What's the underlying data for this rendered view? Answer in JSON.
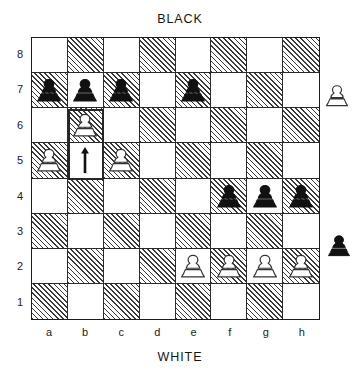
{
  "diagram": {
    "type": "chess-board-diagram",
    "top_side_label": "BLACK",
    "bottom_side_label": "WHITE",
    "orientation": "white-at-bottom",
    "files": [
      "a",
      "b",
      "c",
      "d",
      "e",
      "f",
      "g",
      "h"
    ],
    "ranks": [
      "8",
      "7",
      "6",
      "5",
      "4",
      "3",
      "2",
      "1"
    ],
    "colors": {
      "light_square": "#ffffff",
      "dark_square_hatch": "#3a3a3a",
      "border": "#1c1c1c",
      "highlight_border": "#262626",
      "black_piece": "#111111",
      "white_piece_outline": "#333333"
    },
    "position": {
      "black_pawns": [
        "a7",
        "b7",
        "c7",
        "e7",
        "f4",
        "g4",
        "h4"
      ],
      "white_pawns": [
        "b6",
        "a5",
        "c5",
        "e2",
        "f2",
        "g2",
        "h2"
      ]
    },
    "annotations": {
      "move_arrow": {
        "icon": "up-arrow-icon",
        "square": "b5",
        "direction": "up",
        "meaning": "pawn advance"
      },
      "highlight": {
        "squares": [
          "b6",
          "b5"
        ],
        "meaning": "highlighted move squares"
      }
    },
    "offboard_pieces": [
      {
        "name": "captured-white-pawn",
        "icon": "white-pawn-icon",
        "side": "white",
        "position": "right-upper"
      },
      {
        "name": "captured-black-pawn",
        "icon": "black-pawn-icon",
        "side": "black",
        "position": "right-lower"
      }
    ],
    "squares": [
      [
        {
          "id": "a8",
          "shade": "light",
          "piece": null
        },
        {
          "id": "b8",
          "shade": "dark",
          "piece": null
        },
        {
          "id": "c8",
          "shade": "light",
          "piece": null
        },
        {
          "id": "d8",
          "shade": "dark",
          "piece": null
        },
        {
          "id": "e8",
          "shade": "light",
          "piece": null
        },
        {
          "id": "f8",
          "shade": "dark",
          "piece": null
        },
        {
          "id": "g8",
          "shade": "light",
          "piece": null
        },
        {
          "id": "h8",
          "shade": "dark",
          "piece": null
        }
      ],
      [
        {
          "id": "a7",
          "shade": "dark",
          "piece": "black-pawn"
        },
        {
          "id": "b7",
          "shade": "light",
          "piece": "black-pawn"
        },
        {
          "id": "c7",
          "shade": "dark",
          "piece": "black-pawn"
        },
        {
          "id": "d7",
          "shade": "light",
          "piece": null
        },
        {
          "id": "e7",
          "shade": "dark",
          "piece": "black-pawn"
        },
        {
          "id": "f7",
          "shade": "light",
          "piece": null
        },
        {
          "id": "g7",
          "shade": "dark",
          "piece": null
        },
        {
          "id": "h7",
          "shade": "light",
          "piece": null
        }
      ],
      [
        {
          "id": "a6",
          "shade": "light",
          "piece": null
        },
        {
          "id": "b6",
          "shade": "dark",
          "piece": "white-pawn"
        },
        {
          "id": "c6",
          "shade": "light",
          "piece": null
        },
        {
          "id": "d6",
          "shade": "dark",
          "piece": null
        },
        {
          "id": "e6",
          "shade": "light",
          "piece": null
        },
        {
          "id": "f6",
          "shade": "dark",
          "piece": null
        },
        {
          "id": "g6",
          "shade": "light",
          "piece": null
        },
        {
          "id": "h6",
          "shade": "dark",
          "piece": null
        }
      ],
      [
        {
          "id": "a5",
          "shade": "dark",
          "piece": "white-pawn"
        },
        {
          "id": "b5",
          "shade": "light",
          "piece": "arrow-up"
        },
        {
          "id": "c5",
          "shade": "dark",
          "piece": "white-pawn"
        },
        {
          "id": "d5",
          "shade": "light",
          "piece": null
        },
        {
          "id": "e5",
          "shade": "dark",
          "piece": null
        },
        {
          "id": "f5",
          "shade": "light",
          "piece": null
        },
        {
          "id": "g5",
          "shade": "dark",
          "piece": null
        },
        {
          "id": "h5",
          "shade": "light",
          "piece": null
        }
      ],
      [
        {
          "id": "a4",
          "shade": "light",
          "piece": null
        },
        {
          "id": "b4",
          "shade": "dark",
          "piece": null
        },
        {
          "id": "c4",
          "shade": "light",
          "piece": null
        },
        {
          "id": "d4",
          "shade": "dark",
          "piece": null
        },
        {
          "id": "e4",
          "shade": "light",
          "piece": null
        },
        {
          "id": "f4",
          "shade": "dark",
          "piece": "black-pawn"
        },
        {
          "id": "g4",
          "shade": "light",
          "piece": "black-pawn"
        },
        {
          "id": "h4",
          "shade": "dark",
          "piece": "black-pawn"
        }
      ],
      [
        {
          "id": "a3",
          "shade": "dark",
          "piece": null
        },
        {
          "id": "b3",
          "shade": "light",
          "piece": null
        },
        {
          "id": "c3",
          "shade": "dark",
          "piece": null
        },
        {
          "id": "d3",
          "shade": "light",
          "piece": null
        },
        {
          "id": "e3",
          "shade": "dark",
          "piece": null
        },
        {
          "id": "f3",
          "shade": "light",
          "piece": null
        },
        {
          "id": "g3",
          "shade": "dark",
          "piece": null
        },
        {
          "id": "h3",
          "shade": "light",
          "piece": null
        }
      ],
      [
        {
          "id": "a2",
          "shade": "light",
          "piece": null
        },
        {
          "id": "b2",
          "shade": "dark",
          "piece": null
        },
        {
          "id": "c2",
          "shade": "light",
          "piece": null
        },
        {
          "id": "d2",
          "shade": "dark",
          "piece": null
        },
        {
          "id": "e2",
          "shade": "light",
          "piece": "white-pawn"
        },
        {
          "id": "f2",
          "shade": "dark",
          "piece": "white-pawn"
        },
        {
          "id": "g2",
          "shade": "light",
          "piece": "white-pawn"
        },
        {
          "id": "h2",
          "shade": "dark",
          "piece": "white-pawn"
        }
      ],
      [
        {
          "id": "a1",
          "shade": "dark",
          "piece": null
        },
        {
          "id": "b1",
          "shade": "light",
          "piece": null
        },
        {
          "id": "c1",
          "shade": "dark",
          "piece": null
        },
        {
          "id": "d1",
          "shade": "light",
          "piece": null
        },
        {
          "id": "e1",
          "shade": "dark",
          "piece": null
        },
        {
          "id": "f1",
          "shade": "light",
          "piece": null
        },
        {
          "id": "g1",
          "shade": "dark",
          "piece": null
        },
        {
          "id": "h1",
          "shade": "light",
          "piece": null
        }
      ]
    ]
  }
}
